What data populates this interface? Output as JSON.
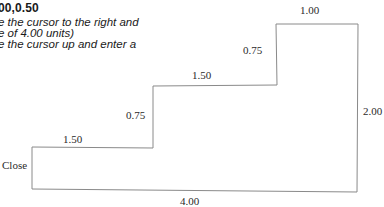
{
  "instructions": {
    "heading": "00,0.50",
    "lines": [
      "e the cursor to the right and",
      "e of 4.00 units)",
      "e the cursor up and enter a"
    ]
  },
  "diagram": {
    "labels": {
      "top_step_width": "1.00",
      "upper_rise": "0.75",
      "right_height": "2.00",
      "middle_step_width": "1.50",
      "lower_rise": "0.75",
      "lower_step_width": "1.50",
      "bottom_width": "4.00",
      "close": "Close"
    },
    "stroke_color": "#8a8a8a"
  }
}
